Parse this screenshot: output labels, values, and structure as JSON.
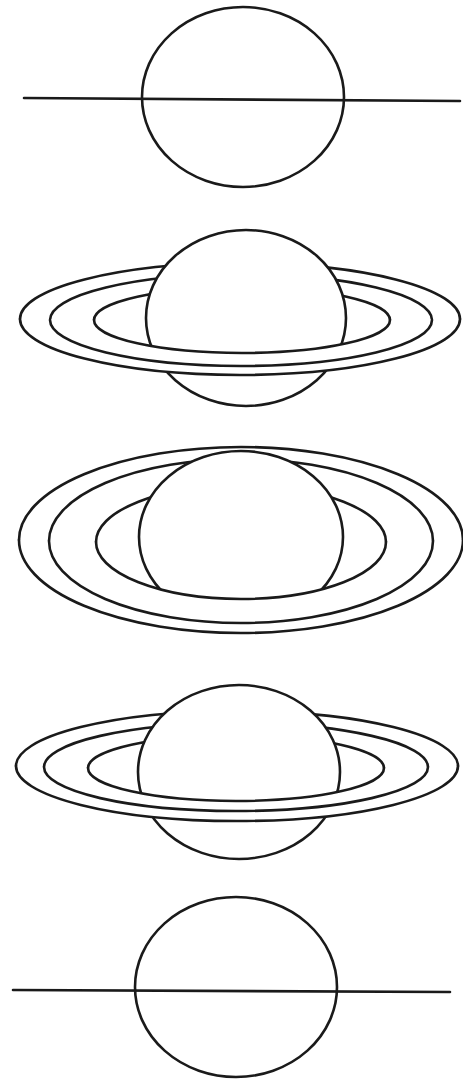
{
  "diagram": {
    "stroke_color": "#1a1a1a",
    "background": "#ffffff",
    "panels": [
      {
        "id": "edge-on-1",
        "label": "Rings edge-on",
        "planet": {
          "cx": 243,
          "cy": 97,
          "rx": 101,
          "ry": 90
        },
        "ring_line": {
          "x1": 24,
          "y1": 98,
          "x2": 460,
          "y2": 101
        }
      },
      {
        "id": "tilted-south-1",
        "label": "Rings partially open (seen from below)",
        "planet": {
          "cx": 246,
          "cy": 318,
          "rx": 100,
          "ry": 88
        },
        "rings": [
          {
            "cx": 240,
            "cy": 319,
            "rx": 220,
            "ry": 56
          },
          {
            "cx": 241,
            "cy": 320,
            "rx": 191,
            "ry": 46
          },
          {
            "cx": 242,
            "cy": 320,
            "rx": 148,
            "ry": 33
          }
        ]
      },
      {
        "id": "max-open",
        "label": "Rings fully open",
        "planet": {
          "cx": 241,
          "cy": 537,
          "rx": 102,
          "ry": 86
        },
        "rings": [
          {
            "cx": 241,
            "cy": 540,
            "rx": 222,
            "ry": 93
          },
          {
            "cx": 241,
            "cy": 541,
            "rx": 192,
            "ry": 82
          },
          {
            "cx": 241,
            "cy": 542,
            "rx": 145,
            "ry": 57
          }
        ]
      },
      {
        "id": "tilted-south-2",
        "label": "Rings partially open (returning)",
        "planet": {
          "cx": 239,
          "cy": 772,
          "rx": 101,
          "ry": 87
        },
        "rings": [
          {
            "cx": 237,
            "cy": 766,
            "rx": 221,
            "ry": 55
          },
          {
            "cx": 236,
            "cy": 767,
            "rx": 192,
            "ry": 44
          },
          {
            "cx": 236,
            "cy": 768,
            "rx": 148,
            "ry": 33
          }
        ]
      },
      {
        "id": "edge-on-2",
        "label": "Rings edge-on again",
        "planet": {
          "cx": 236,
          "cy": 987,
          "rx": 101,
          "ry": 90
        },
        "ring_line": {
          "x1": 13,
          "y1": 990,
          "x2": 450,
          "y2": 992
        }
      }
    ]
  }
}
